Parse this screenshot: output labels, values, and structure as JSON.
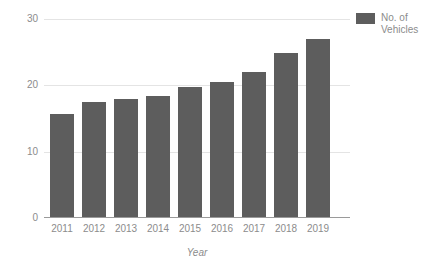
{
  "chart_data": {
    "type": "bar",
    "title": "",
    "subtitle": "",
    "xlabel": "Year",
    "ylabel": "",
    "categories": [
      "2011",
      "2012",
      "2013",
      "2014",
      "2015",
      "2016",
      "2017",
      "2018",
      "2019"
    ],
    "series": [
      {
        "name": "No. of Vehicles",
        "values": [
          15.5,
          17.3,
          17.8,
          18.3,
          19.6,
          20.4,
          21.9,
          24.8,
          26.8
        ]
      }
    ],
    "values": [
      15.5,
      17.3,
      17.8,
      18.3,
      19.6,
      20.4,
      21.9,
      24.8,
      26.8
    ],
    "ylim": [
      0,
      30
    ],
    "y_ticks": [
      "0",
      "10",
      "20",
      "30"
    ],
    "y_tick_values": [
      0,
      10,
      20,
      30
    ],
    "grid": true,
    "legend_position": "top-right",
    "bar_color": "#5d5d5d",
    "gridline_color": "#e4e4e4",
    "axis_color": "#9a9a9a",
    "text_color": "#8c8c8c",
    "background_color": "#ffffff"
  },
  "legend": {
    "entries": [
      {
        "label": "No. of Vehicles",
        "color": "#5d5d5d",
        "swatch_icon": "legend-square-icon"
      }
    ]
  },
  "axes": {
    "x_title": "Year",
    "y_title": ""
  }
}
